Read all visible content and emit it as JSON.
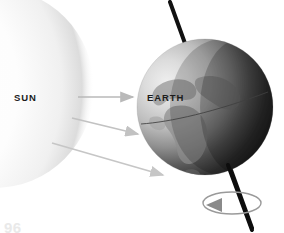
{
  "figure": {
    "background_color": "#ffffff",
    "width": 284,
    "height": 233
  },
  "sun": {
    "label": "SUN",
    "center_x": -6,
    "center_y": 88,
    "radius": 96,
    "core_color": "#ffffff",
    "glow_color": "#d8d8d8",
    "icon": "sun-glow-icon"
  },
  "earth": {
    "label": "EARTH",
    "center_x": 205,
    "center_y": 107,
    "radius": 68,
    "lit_color": "#d9d9d9",
    "dark_color": "#1f1f1f",
    "terminator_note": "day side on left facing Sun, night side on right",
    "icon": "earth-globe-icon",
    "continents_color": "#8e8e8e"
  },
  "axis": {
    "name": "rotation-axis",
    "color": "#111111",
    "tilt_degrees": 23.5,
    "top_x": 170,
    "top_y": 2,
    "bottom_x": 252,
    "bottom_y": 228,
    "stroke_width": 4
  },
  "equator": {
    "name": "equator-line",
    "color": "#4a4a4a",
    "stroke_width": 1
  },
  "rotation_arrow": {
    "name": "rotation-direction-arrow",
    "color": "#8c8c8c",
    "arrow_fill": "#7d7d7d",
    "center_x": 232,
    "center_y": 203,
    "rx": 28,
    "ry": 11
  },
  "sunlight_rays": [
    {
      "name": "sunlight-ray-1",
      "x1": 78,
      "y1": 97,
      "x2": 135,
      "y2": 97,
      "color": "#b4b4b4"
    },
    {
      "name": "sunlight-ray-2",
      "x1": 72,
      "y1": 118,
      "x2": 140,
      "y2": 134,
      "color": "#c2c2c2"
    },
    {
      "name": "sunlight-ray-3",
      "x1": 52,
      "y1": 143,
      "x2": 165,
      "y2": 175,
      "color": "#c6c6c6"
    }
  ],
  "page": {
    "number": "96"
  }
}
